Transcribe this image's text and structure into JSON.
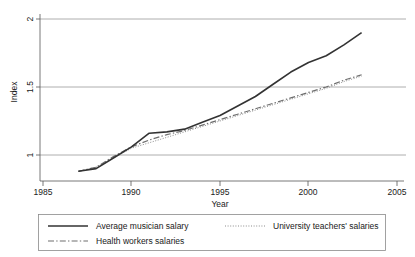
{
  "chart_data": {
    "type": "line",
    "title": "",
    "xlabel": "Year",
    "ylabel": "Index",
    "xlim": [
      1985,
      2005
    ],
    "ylim": [
      0.82,
      2.05
    ],
    "xticks": [
      1985,
      1990,
      1995,
      2000,
      2005
    ],
    "xtick_labels": [
      "1985",
      "1990",
      "1995",
      "2000",
      "2005"
    ],
    "yticks": [
      1,
      1.5,
      2
    ],
    "ytick_labels": [
      "1",
      "1.5",
      "2"
    ],
    "grid": "horizontal",
    "legend_position": "below-plot",
    "x": [
      1987,
      1988,
      1989,
      1990,
      1991,
      1992,
      1993,
      1994,
      1995,
      1996,
      1997,
      1998,
      1999,
      2000,
      2001,
      2002,
      2003
    ],
    "series": [
      {
        "name": "Average musician salary",
        "style": "solid",
        "color": "#333333",
        "values": [
          0.88,
          0.9,
          0.98,
          1.06,
          1.16,
          1.17,
          1.19,
          1.24,
          1.29,
          1.36,
          1.43,
          1.52,
          1.61,
          1.68,
          1.73,
          1.81,
          1.9
        ]
      },
      {
        "name": "University teachers' salaries",
        "style": "dotted",
        "color": "#8c8c8c",
        "values": [
          0.88,
          0.91,
          0.98,
          1.05,
          1.09,
          1.13,
          1.17,
          1.21,
          1.25,
          1.29,
          1.33,
          1.37,
          1.41,
          1.45,
          1.49,
          1.54,
          1.58
        ]
      },
      {
        "name": "Health workers salaries",
        "style": "dashdot",
        "color": "#6e6e6e",
        "values": [
          0.88,
          0.91,
          0.99,
          1.06,
          1.11,
          1.15,
          1.18,
          1.22,
          1.26,
          1.3,
          1.34,
          1.38,
          1.42,
          1.46,
          1.5,
          1.55,
          1.59
        ]
      }
    ]
  },
  "legend": {
    "items": [
      {
        "label": "Average musician salary",
        "style": "solid"
      },
      {
        "label": "University teachers' salaries",
        "style": "dotted"
      },
      {
        "label": "Health workers salaries",
        "style": "dashdot"
      }
    ]
  }
}
